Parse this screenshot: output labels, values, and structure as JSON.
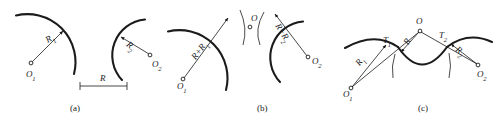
{
  "figure": {
    "width": 498,
    "height": 121,
    "ink_color": "#1b1b1b",
    "background": "#ffffff"
  },
  "panels": [
    {
      "id": "a",
      "caption": "(a)",
      "caption_pos": {
        "x": 70,
        "y": 103
      },
      "labels": [
        {
          "key": "center1",
          "text": "O",
          "sub": "1",
          "x": 26,
          "y": 70
        },
        {
          "key": "radius1",
          "text": "R",
          "sub": "1",
          "x": 44,
          "y": 37,
          "rotate": -32
        },
        {
          "key": "center2",
          "text": "O",
          "sub": "2",
          "x": 152,
          "y": 60
        },
        {
          "key": "radius2",
          "text": "R",
          "sub": "2",
          "x": 130,
          "y": 40,
          "rotate": 38
        },
        {
          "key": "distance",
          "text": "R",
          "sub": "",
          "x": 103,
          "y": 75
        }
      ]
    },
    {
      "id": "b",
      "caption": "(b)",
      "caption_pos": {
        "x": 257,
        "y": 103
      },
      "labels": [
        {
          "key": "center1",
          "text": "O",
          "sub": "1",
          "x": 177,
          "y": 82
        },
        {
          "key": "sumradius1",
          "text": "R+R",
          "sub": "1",
          "x": 194,
          "y": 52,
          "rotate": -45
        },
        {
          "key": "centerO",
          "text": "O",
          "sub": "",
          "x": 248,
          "y": 17
        },
        {
          "key": "sumradius2",
          "text": "R+R",
          "sub": "2",
          "x": 282,
          "y": 24,
          "rotate": 62
        },
        {
          "key": "center2",
          "text": "O",
          "sub": "2",
          "x": 314,
          "y": 63
        }
      ]
    },
    {
      "id": "c",
      "caption": "(c)",
      "caption_pos": {
        "x": 418,
        "y": 103
      },
      "labels": [
        {
          "key": "center1",
          "text": "O",
          "sub": "1",
          "x": 343,
          "y": 92
        },
        {
          "key": "radius1",
          "text": "R",
          "sub": "1",
          "x": 355,
          "y": 64,
          "rotate": -60
        },
        {
          "key": "tangent1",
          "text": "T",
          "sub": "1",
          "x": 385,
          "y": 39
        },
        {
          "key": "radiusR",
          "text": "R",
          "sub": "",
          "x": 400,
          "y": 50,
          "rotate": -62
        },
        {
          "key": "centerO",
          "text": "O",
          "sub": "",
          "x": 412,
          "y": 17
        },
        {
          "key": "tangent2",
          "text": "T",
          "sub": "2",
          "x": 441,
          "y": 34
        },
        {
          "key": "radius2",
          "text": "R",
          "sub": "2",
          "x": 461,
          "y": 47,
          "rotate": 38
        },
        {
          "key": "center2",
          "text": "O",
          "sub": "2",
          "x": 478,
          "y": 70
        }
      ]
    }
  ]
}
